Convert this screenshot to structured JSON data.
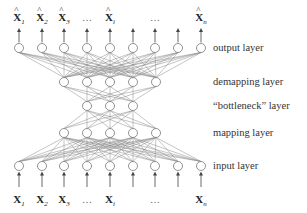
{
  "diagram": {
    "type": "autoassociative neural network",
    "layers": [
      {
        "name": "output layer",
        "label": "output layer",
        "node_count": 9,
        "y": 48,
        "xs": [
          19,
          42,
          64,
          87,
          110,
          133,
          155,
          178,
          201
        ]
      },
      {
        "name": "demapping layer",
        "label": "demapping layer",
        "node_count": 5,
        "y": 82,
        "xs": [
          64,
          87,
          110,
          133,
          156
        ]
      },
      {
        "name": "bottleneck layer",
        "label": "“bottleneck” layer",
        "node_count": 3,
        "y": 106,
        "xs": [
          87,
          110,
          133
        ]
      },
      {
        "name": "mapping layer",
        "label": "mapping layer",
        "node_count": 5,
        "y": 133,
        "xs": [
          64,
          87,
          110,
          133,
          156
        ]
      },
      {
        "name": "input layer",
        "label": "input layer",
        "node_count": 9,
        "y": 166,
        "xs": [
          19,
          42,
          64,
          87,
          110,
          133,
          155,
          178,
          201
        ]
      }
    ],
    "output_variables": [
      {
        "base": "X",
        "sub": "1",
        "hat": true,
        "x": 19
      },
      {
        "base": "X",
        "sub": "2",
        "hat": true,
        "x": 42
      },
      {
        "base": "X",
        "sub": "3",
        "hat": true,
        "x": 64
      },
      {
        "base": "…",
        "sub": "",
        "hat": false,
        "x": 87
      },
      {
        "base": "X",
        "sub": "i",
        "hat": true,
        "x": 110
      },
      {
        "base": "…",
        "sub": "",
        "hat": false,
        "x": 155
      },
      {
        "base": "X",
        "sub": "n",
        "hat": true,
        "x": 201
      }
    ],
    "input_variables": [
      {
        "base": "X",
        "sub": "1",
        "hat": false,
        "x": 19
      },
      {
        "base": "X",
        "sub": "2",
        "hat": false,
        "x": 42
      },
      {
        "base": "X",
        "sub": "3",
        "hat": false,
        "x": 64
      },
      {
        "base": "…",
        "sub": "",
        "hat": false,
        "x": 87
      },
      {
        "base": "X",
        "sub": "i",
        "hat": false,
        "x": 110
      },
      {
        "base": "…",
        "sub": "",
        "hat": false,
        "x": 155
      },
      {
        "base": "X",
        "sub": "n",
        "hat": false,
        "x": 201
      }
    ],
    "colors": {
      "node_stroke": "#777777",
      "edge": "#8a8a8a",
      "arrow": "#444444",
      "text": "#222222"
    }
  }
}
